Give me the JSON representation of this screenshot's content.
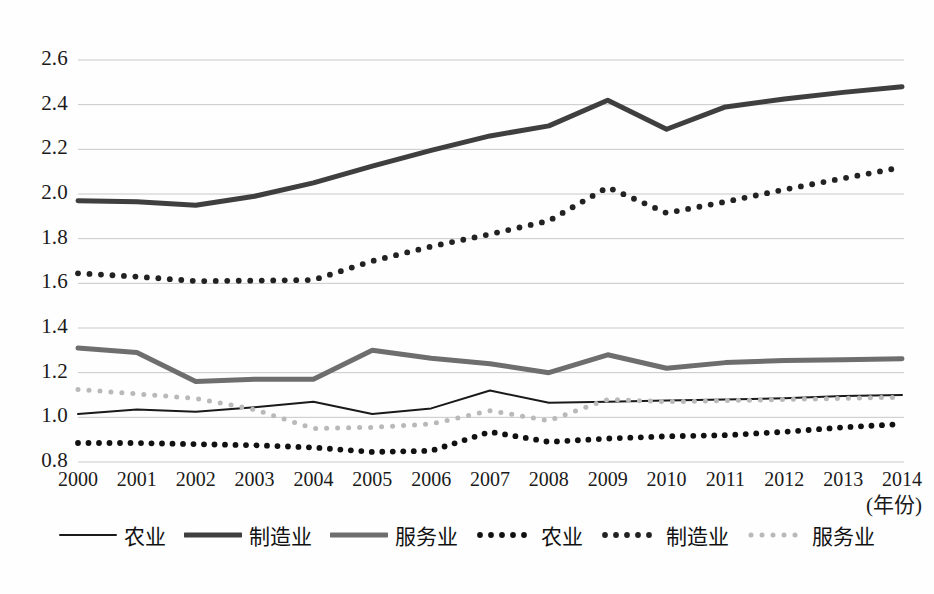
{
  "chart_data": {
    "type": "line",
    "title": "",
    "subtitle": "",
    "xlabel": "(年份)",
    "ylabel": "",
    "grid": true,
    "legend_position": "bottom",
    "xlim": [
      2000,
      2014
    ],
    "ylim": [
      0.8,
      2.6
    ],
    "ytick_step": 0.2,
    "categories": [
      "2000",
      "2001",
      "2002",
      "2003",
      "2004",
      "2005",
      "2006",
      "2007",
      "2008",
      "2009",
      "2010",
      "2011",
      "2012",
      "2013",
      "2014"
    ],
    "yticks": [
      "0.8",
      "1.0",
      "1.2",
      "1.4",
      "1.6",
      "1.8",
      "2.0",
      "2.2",
      "2.4",
      "2.6"
    ],
    "series": [
      {
        "name": "农业",
        "style": "solid-thin",
        "color": "#1a1a1a",
        "values": [
          1.015,
          1.035,
          1.025,
          1.045,
          1.07,
          1.015,
          1.04,
          1.12,
          1.065,
          1.07,
          1.075,
          1.08,
          1.085,
          1.095,
          1.1
        ]
      },
      {
        "name": "制造业",
        "style": "solid-thick",
        "color": "#3f3f3f",
        "values": [
          1.97,
          1.965,
          1.95,
          1.99,
          2.05,
          2.125,
          2.195,
          2.26,
          2.305,
          2.42,
          2.29,
          2.39,
          2.425,
          2.455,
          2.48
        ]
      },
      {
        "name": "服务业",
        "style": "solid-thick-gray",
        "color": "#6e6e6e",
        "values": [
          1.31,
          1.29,
          1.16,
          1.17,
          1.17,
          1.3,
          1.265,
          1.24,
          1.2,
          1.28,
          1.22,
          1.245,
          1.255,
          1.258,
          1.262
        ]
      },
      {
        "name": "农业",
        "style": "dotted-dark",
        "color": "#111111",
        "values": [
          0.885,
          0.885,
          0.88,
          0.875,
          0.865,
          0.845,
          0.85,
          0.935,
          0.89,
          0.905,
          0.915,
          0.92,
          0.935,
          0.955,
          0.97
        ]
      },
      {
        "name": "制造业",
        "style": "dotted-mid",
        "color": "#222222",
        "values": [
          1.645,
          1.63,
          1.61,
          1.612,
          1.615,
          1.7,
          1.765,
          1.82,
          1.88,
          2.03,
          1.915,
          1.965,
          2.02,
          2.07,
          2.12
        ]
      },
      {
        "name": "服务业",
        "style": "dotted-light",
        "color": "#b9b9b9",
        "values": [
          1.125,
          1.105,
          1.085,
          1.035,
          0.95,
          0.955,
          0.97,
          1.03,
          0.985,
          1.08,
          1.07,
          1.075,
          1.08,
          1.085,
          1.09
        ]
      }
    ]
  }
}
